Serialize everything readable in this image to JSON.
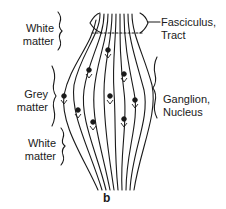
{
  "diagram": {
    "type": "anatomical-schematic",
    "figure_label": "b",
    "left_labels": [
      {
        "id": "white-matter-top",
        "line1": "White",
        "line2": "matter"
      },
      {
        "id": "grey-matter",
        "line1": "Grey",
        "line2": "matter"
      },
      {
        "id": "white-matter-bottom",
        "line1": "White",
        "line2": "matter"
      }
    ],
    "right_labels": [
      {
        "id": "fasciculus-tract",
        "line1": "Fasciculus,",
        "line2": "Tract"
      },
      {
        "id": "ganglion-nucleus",
        "line1": "Ganglion,",
        "line2": "Nucleus"
      }
    ],
    "colors": {
      "ink": "#1a1a1a",
      "background": "#ffffff"
    }
  }
}
